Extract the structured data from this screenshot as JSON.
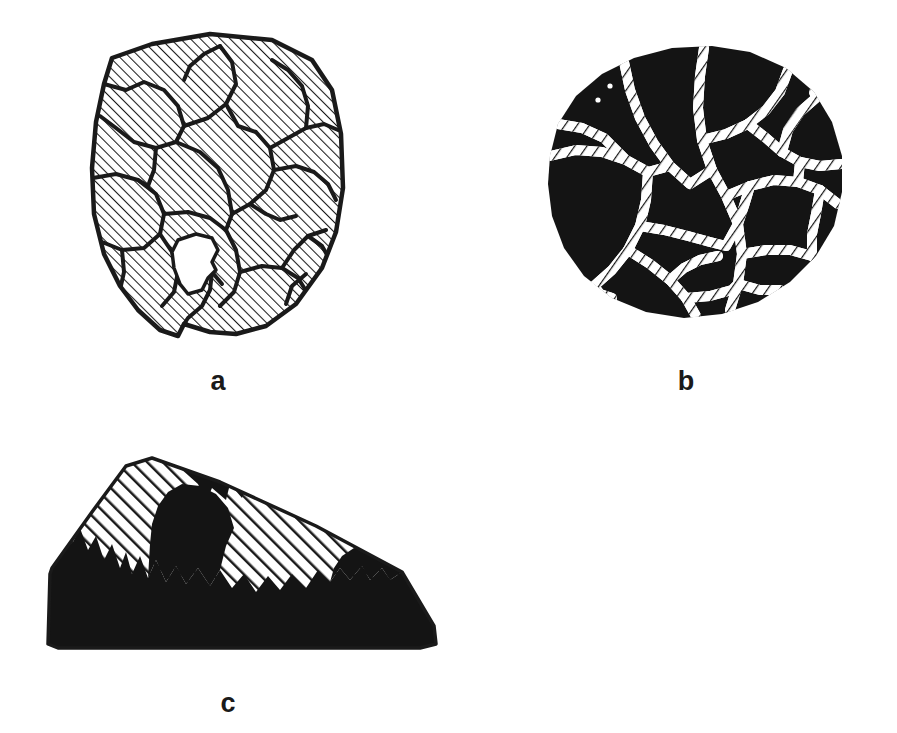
{
  "figure": {
    "width": 897,
    "height": 733,
    "background_color": "#ffffff",
    "ink_color": "#1a1a1a"
  },
  "panels": [
    {
      "id": "a",
      "label": "a",
      "label_position": {
        "x": 217,
        "y": 382
      },
      "bounds": {
        "x": 60,
        "y": 18,
        "width": 300,
        "height": 330
      },
      "shape": "irregular rounded polygon",
      "fill_style": "diagonal-hatch-45",
      "hatch": {
        "angle_deg": 45,
        "line_width_px": 2,
        "spacing_px": 7,
        "color": "#1a1a1a"
      },
      "outline": {
        "color": "#1a1a1a",
        "width_px": 4
      },
      "internal_network": "thick black branching boundary lines subdividing the hatched field into polygonal cells",
      "voids": 1,
      "void_note": "one small white unhatched region near lower-centre"
    },
    {
      "id": "b",
      "label": "b",
      "label_position": {
        "x": 685,
        "y": 382
      },
      "bounds": {
        "x": 498,
        "y": 28,
        "width": 355,
        "height": 310
      },
      "shape": "rounded blob, nearly circular",
      "fill_style": "solid-black",
      "fill_color": "#141414",
      "internal_network": "white rope-textured channels forming a cellular network (inverse of panel a)",
      "channel_color": "#ffffff",
      "channel_width_px": 9,
      "speckles": 2,
      "speckle_note": "two tiny white dots near upper-left of blob"
    },
    {
      "id": "c",
      "label": "c",
      "label_position": {
        "x": 228,
        "y": 705
      },
      "bounds": {
        "x": 30,
        "y": 440,
        "width": 420,
        "height": 215
      },
      "shape": "quadrilateral with flat base, apex upper-left, sloping right edge",
      "fill_style": "split: solid-black lower mass, diagonal-hatch upper rim",
      "fill_color": "#141414",
      "hatch": {
        "angle_deg": 45,
        "line_width_px": 5,
        "spacing_px": 11,
        "color": "#1a1a1a"
      },
      "boundary_note": "jagged irregular interface between black mass and hatched rim"
    }
  ],
  "labels": {
    "a": "a",
    "b": "b",
    "c": "c"
  }
}
